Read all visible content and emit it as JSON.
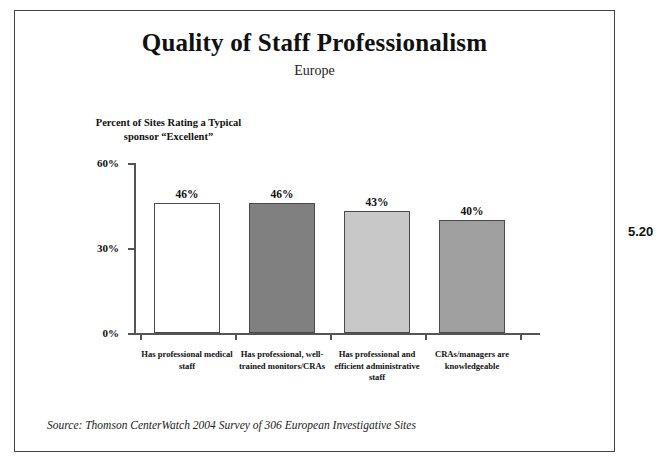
{
  "figure_number": "5.20",
  "header": {
    "title": "Quality of Staff Professionalism",
    "subtitle": "Europe"
  },
  "axis_caption": {
    "line1": "Percent of Sites Rating a Typical",
    "line2": "sponsor “Excellent”"
  },
  "source": "Source:  Thomson CenterWatch 2004 Survey of 306 European Investigative Sites",
  "chart_data": {
    "type": "bar",
    "title": "Quality of Staff Professionalism",
    "subtitle": "Europe",
    "xlabel": "",
    "ylabel": "Percent of Sites Rating a Typical sponsor “Excellent”",
    "ylim": [
      0,
      60
    ],
    "yticks": [
      0,
      30,
      60
    ],
    "ytick_labels": [
      "0%",
      "30%",
      "60%"
    ],
    "grid": false,
    "legend": "none",
    "categories": [
      "Has professional medical staff",
      "Has professional, well-trained monitors/CRAs",
      "Has professional and efficient administrative staff",
      "CRAs/managers are knowledgeable"
    ],
    "category_lines": [
      [
        "Has professional medical",
        "staff"
      ],
      [
        "Has professional, well-",
        "trained monitors/CRAs"
      ],
      [
        "Has professional and",
        "efficient administrative",
        "staff"
      ],
      [
        "CRAs/managers are",
        "knowledgeable"
      ]
    ],
    "values": [
      46,
      46,
      43,
      40
    ],
    "value_labels": [
      "46%",
      "46%",
      "43%",
      "40%"
    ],
    "bar_colors": [
      "#ffffff",
      "#808080",
      "#c8c8c8",
      "#a0a0a0"
    ],
    "bar_edge_color": "#4a4a4a"
  }
}
